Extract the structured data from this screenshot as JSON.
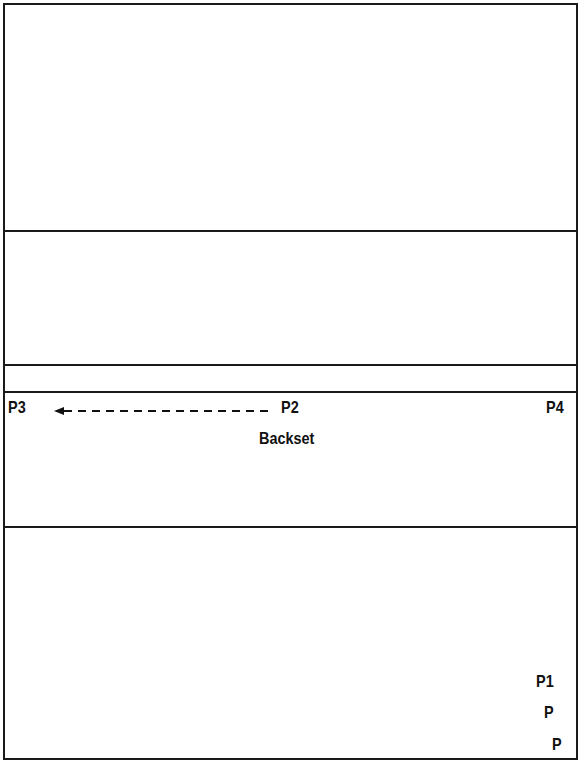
{
  "diagram": {
    "type": "position-diagram",
    "bands": [
      {
        "name": "band-1",
        "top": 4,
        "bottom": 231
      },
      {
        "name": "band-2",
        "top": 231,
        "bottom": 365
      },
      {
        "name": "band-3",
        "top": 365,
        "bottom": 392
      },
      {
        "name": "band-4",
        "top": 392,
        "bottom": 527
      },
      {
        "name": "band-5",
        "top": 527,
        "bottom": 757
      }
    ],
    "labels": {
      "p3": "P3",
      "p2": "P2",
      "p4": "P4",
      "backset": "Backset",
      "p1": "P1",
      "p_a": "P",
      "p_b": "P"
    },
    "arrow": {
      "from": "P2",
      "to": "P3",
      "style": "dashed",
      "label": "Backset"
    },
    "colors": {
      "line": "#1a1a1a",
      "text": "#111111",
      "background": "#ffffff"
    }
  }
}
